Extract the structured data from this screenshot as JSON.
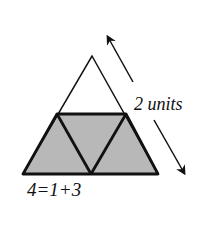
{
  "diagram": {
    "type": "subdivided-triangle",
    "fill_color": "#b8b8b8",
    "stroke_color": "#111111",
    "label_side": "2 units",
    "label_equation": "4=1+3",
    "regions": [
      {
        "name": "top-triangle",
        "shaded": false
      },
      {
        "name": "bottom-left-triangle",
        "shaded": true
      },
      {
        "name": "middle-inverted-triangle",
        "shaded": true
      },
      {
        "name": "bottom-right-triangle",
        "shaded": true
      }
    ]
  }
}
